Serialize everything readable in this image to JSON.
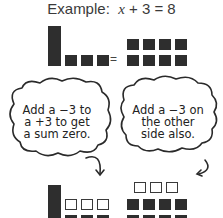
{
  "title": {
    "prefix": "Example:",
    "equation_var": "x",
    "equation_rest": "+ 3 = 8"
  },
  "top_model": {
    "left_side": {
      "x_bars": 1,
      "positive_units": 3
    },
    "equals": "=",
    "right_side": {
      "positive_units": 8
    }
  },
  "bubbles": {
    "left": {
      "text": "Add a −3 to\na +3 to get\na sum zero."
    },
    "right": {
      "text": "Add a −3 on\nthe other\nside also."
    }
  },
  "bottom_model": {
    "left_side": {
      "x_bars": 1,
      "negative_units": 3,
      "positive_units": 3
    },
    "right_side": {
      "negative_units": 3,
      "positive_units": 8
    }
  },
  "colors": {
    "filled_tile": "#2e2e2e",
    "outline_tile": "#3a3a3a",
    "background": "#ffffff"
  }
}
